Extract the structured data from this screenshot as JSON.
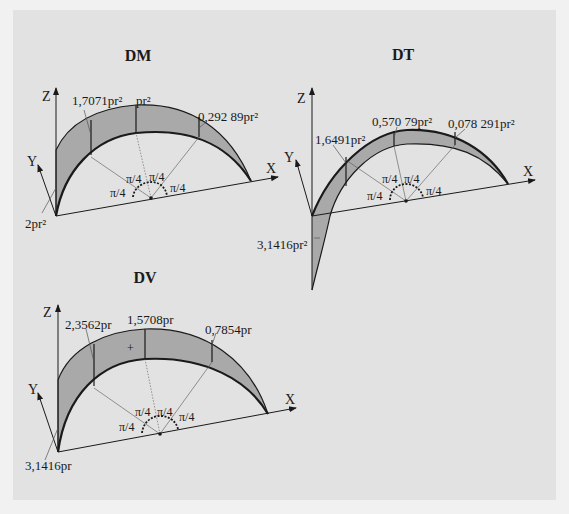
{
  "figure": {
    "background": "#f1f1f1",
    "panel_color": "#e2e2e2",
    "shading_color": "#a9a9a9",
    "line_color": "#1a1a1a"
  },
  "diagrams": [
    {
      "id": "dm",
      "title": "DM",
      "axes": {
        "z": "Z",
        "y": "Y",
        "x": "X"
      },
      "values": {
        "origin": "2pr²",
        "first_quarter": "1,7071pr²",
        "top": "pr²",
        "third_quarter": "0,292 89pr²"
      },
      "angle_label": "π/4"
    },
    {
      "id": "dt",
      "title": "DT",
      "axes": {
        "z": "Z",
        "y": "Y",
        "x": "X"
      },
      "values": {
        "origin": "3,1416pr²",
        "first_quarter": "1,6491pr²",
        "top": "0,570 79pr²",
        "third_quarter": "0,078 291pr²"
      },
      "angle_label": "π/4"
    },
    {
      "id": "dv",
      "title": "DV",
      "axes": {
        "z": "Z",
        "y": "Y",
        "x": "X"
      },
      "values": {
        "origin": "3,1416pr",
        "first_quarter": "2,3562pr",
        "top": "1,5708pr",
        "third_quarter": "0,7854pr"
      },
      "angle_label": "π/4"
    }
  ]
}
